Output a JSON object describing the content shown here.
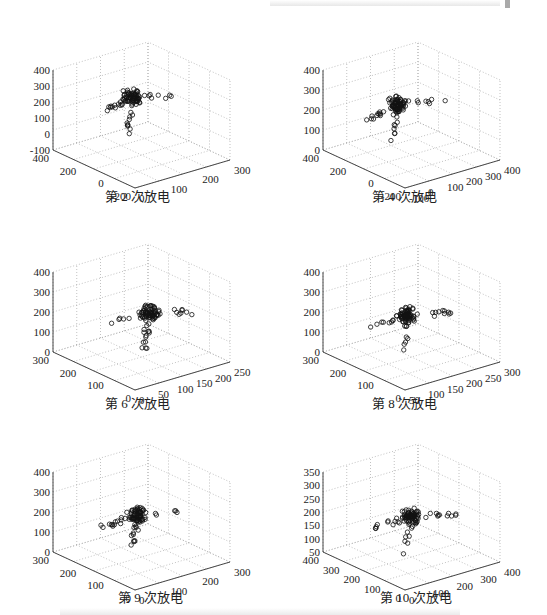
{
  "chart_data": [
    {
      "type": "scatter",
      "title": "第 2 次放电",
      "caption": "第 2 次放电",
      "zticks": [
        "400",
        "300",
        "200",
        "100",
        "0",
        "-100"
      ],
      "yticks": [
        "400",
        "200",
        "0",
        "-200"
      ],
      "xticks": [
        "0",
        "100",
        "200",
        "300"
      ],
      "zlim": [
        -100,
        400
      ],
      "ylim": [
        -200,
        400
      ],
      "xlim": [
        0,
        300
      ],
      "grid": true
    },
    {
      "type": "scatter",
      "title": "第 4 次放电",
      "caption": "第 4 次放电",
      "zticks": [
        "400",
        "300",
        "200",
        "100",
        "0"
      ],
      "yticks": [
        "400",
        "200",
        "0",
        "-200"
      ],
      "xticks": [
        "-100",
        "0",
        "100",
        "200",
        "300",
        "400"
      ],
      "zlim": [
        0,
        400
      ],
      "ylim": [
        -200,
        400
      ],
      "xlim": [
        -100,
        400
      ],
      "grid": true
    },
    {
      "type": "scatter",
      "title": "第 6 次放电",
      "caption": "第 6 次放电",
      "zticks": [
        "400",
        "300",
        "200",
        "100",
        "0"
      ],
      "yticks": [
        "300",
        "200",
        "100",
        "0"
      ],
      "xticks": [
        "0",
        "50",
        "100",
        "150",
        "200",
        "250"
      ],
      "zlim": [
        0,
        400
      ],
      "ylim": [
        0,
        300
      ],
      "xlim": [
        0,
        250
      ],
      "grid": true
    },
    {
      "type": "scatter",
      "title": "第 8 次放电",
      "caption": "第 8 次放电",
      "zticks": [
        "400",
        "300",
        "200",
        "100",
        "0"
      ],
      "yticks": [
        "300",
        "200",
        "100",
        "0"
      ],
      "xticks": [
        "50",
        "100",
        "150",
        "200",
        "250",
        "300"
      ],
      "zlim": [
        0,
        400
      ],
      "ylim": [
        0,
        300
      ],
      "xlim": [
        50,
        300
      ],
      "grid": true
    },
    {
      "type": "scatter",
      "title": "第 9 次放电",
      "caption": "第 9 次放电",
      "zticks": [
        "400",
        "300",
        "200",
        "100",
        "0"
      ],
      "yticks": [
        "300",
        "200",
        "100",
        "0"
      ],
      "xticks": [
        "0",
        "100",
        "200",
        "300"
      ],
      "zlim": [
        0,
        400
      ],
      "ylim": [
        0,
        300
      ],
      "xlim": [
        0,
        300
      ],
      "grid": true
    },
    {
      "type": "scatter",
      "title": "第 10 次放电",
      "caption": "第 10 次放电",
      "zticks": [
        "350",
        "300",
        "250",
        "200",
        "150",
        "100",
        "50"
      ],
      "yticks": [
        "400",
        "300",
        "200",
        "100",
        "0"
      ],
      "xticks": [
        "0",
        "100",
        "200",
        "300",
        "400"
      ],
      "zlim": [
        50,
        350
      ],
      "ylim": [
        0,
        400
      ],
      "xlim": [
        0,
        400
      ],
      "grid": true
    }
  ],
  "captions": [
    "第 2 次放电",
    "第 4 次放电",
    "第 6 次放电",
    "第 8 次放电",
    "第 9 次放电",
    "第 10 次放电"
  ]
}
